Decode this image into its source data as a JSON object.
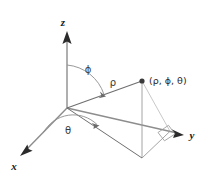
{
  "figure": {
    "type": "spherical-coordinates-diagram",
    "background_color": "#ffffff",
    "axis_color": "#8d8d8d",
    "arrow_color": "#2b2b2b",
    "line_color": "#8d8d8d",
    "label_color": "#1a1a1a"
  },
  "axes": [
    {
      "id": "z",
      "label": "z"
    },
    {
      "id": "y",
      "label": "y"
    },
    {
      "id": "x",
      "label": "x"
    }
  ],
  "angles": [
    {
      "id": "phi",
      "label": "ϕ",
      "description": "angle from positive z-axis to rho"
    },
    {
      "id": "theta",
      "label": "θ",
      "description": "angle from positive x-axis in xy-plane"
    }
  ],
  "segments": [
    {
      "id": "rho",
      "label": "ρ",
      "description": "radial distance from origin to point"
    }
  ],
  "point": {
    "label": "(ρ, ϕ, θ)",
    "marker": "filled-dot"
  },
  "markers": [
    {
      "id": "right-angle",
      "label": "",
      "description": "right angle marker in xy-plane"
    }
  ]
}
